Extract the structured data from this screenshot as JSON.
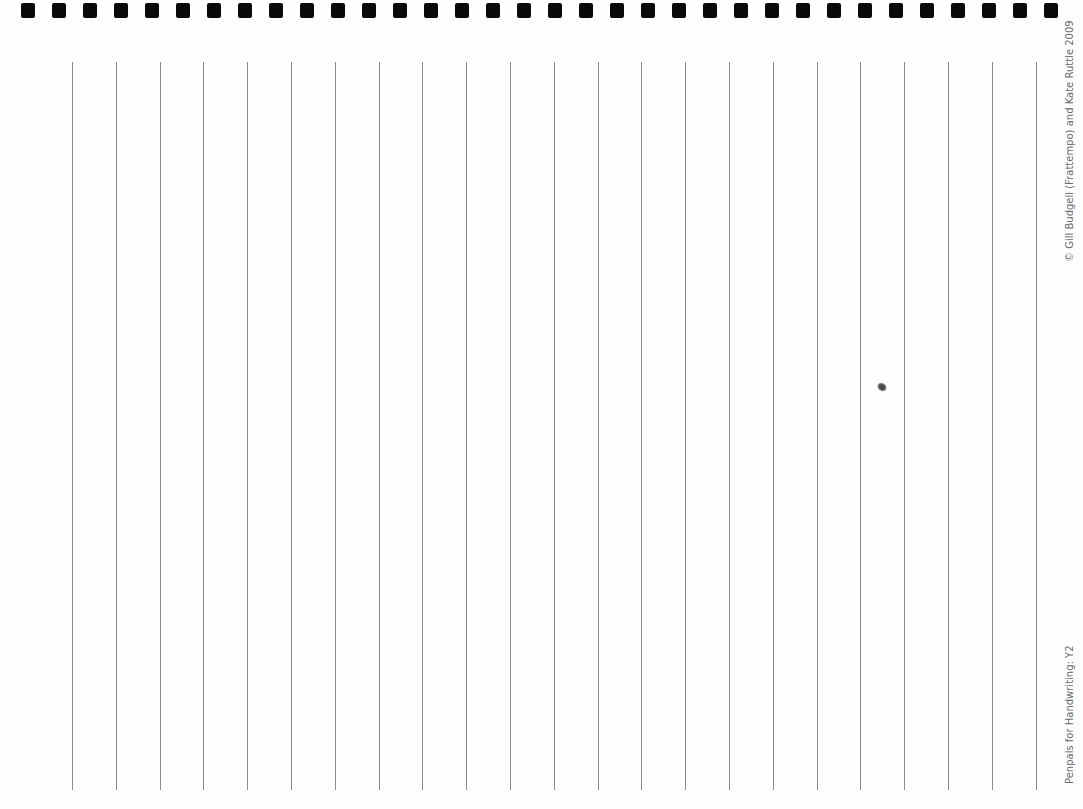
{
  "document": {
    "type": "handwriting-practice-sheet",
    "orientation": "landscape-rotated",
    "binding_holes": {
      "count": 34,
      "start_x": 21,
      "spacing": 31,
      "color": "#0a0a0a"
    },
    "rules": {
      "count": 23,
      "start_x": 72,
      "spacing": 43.8,
      "top": 62,
      "length": 728,
      "color": "#8a8a8a"
    },
    "copyright_text": "© Gill Budgell (Frattempo) and Kate Ruttle 2009",
    "footer_title": "Penpals for Handwriting: Y2"
  }
}
